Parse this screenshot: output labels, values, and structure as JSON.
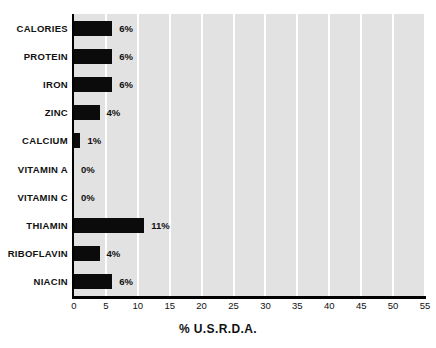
{
  "chart_data": {
    "type": "bar",
    "orientation": "horizontal",
    "title": "",
    "xlabel": "% U.S.R.D.A.",
    "ylabel": "",
    "xlim": [
      0,
      55
    ],
    "xticks": [
      "0",
      "5",
      "10",
      "15",
      "20",
      "25",
      "30",
      "35",
      "40",
      "45",
      "50",
      "55"
    ],
    "grid": "vertical",
    "legend": "none",
    "categories": [
      "CALORIES",
      "PROTEIN",
      "IRON",
      "ZINC",
      "CALCIUM",
      "VITAMIN A",
      "VITAMIN C",
      "THIAMIN",
      "RIBOFLAVIN",
      "NIACIN"
    ],
    "values": [
      6,
      6,
      6,
      4,
      1,
      0,
      0,
      11,
      4,
      6
    ],
    "value_labels": [
      "6%",
      "6%",
      "6%",
      "4%",
      "1%",
      "0%",
      "0%",
      "11%",
      "4%",
      "6%"
    ],
    "colors": {
      "bar": "#0b0b0b",
      "plot_background": "#e2e2e2",
      "gridline": "#ffffff",
      "axis": "#000000",
      "text": "#111111",
      "page_background": "#ffffff"
    }
  }
}
